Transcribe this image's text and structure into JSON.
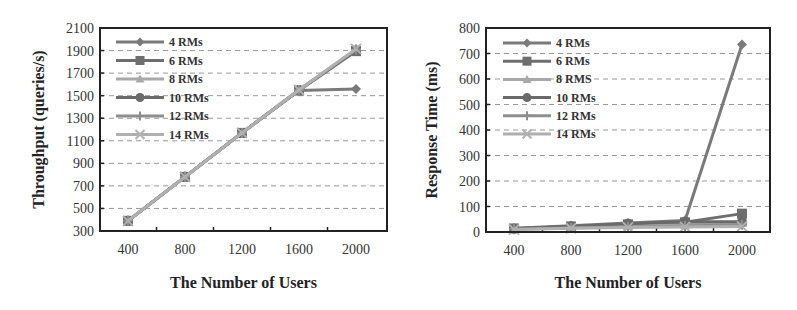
{
  "chart_data": [
    {
      "type": "line",
      "title": "",
      "xlabel": "The Number of Users",
      "ylabel": "Throughput (queries/s)",
      "categories": [
        "400",
        "800",
        "1200",
        "1600",
        "2000"
      ],
      "x": [
        400,
        800,
        1200,
        1600,
        2000
      ],
      "ylim": [
        300,
        2100
      ],
      "yticks": [
        300,
        500,
        700,
        900,
        1100,
        1300,
        1500,
        1700,
        1900,
        2100
      ],
      "grid": "horizontal dashed",
      "legend_position": "upper left inside",
      "series": [
        {
          "name": "4 RMs",
          "marker": "diamond",
          "values": [
            390,
            780,
            1170,
            1545,
            1560
          ]
        },
        {
          "name": "6 RMs",
          "marker": "square",
          "values": [
            390,
            780,
            1170,
            1545,
            1895
          ]
        },
        {
          "name": "8 RMs",
          "marker": "triangle",
          "values": [
            390,
            780,
            1170,
            1550,
            1905
          ]
        },
        {
          "name": "10 RMs",
          "marker": "circle",
          "values": [
            390,
            780,
            1170,
            1550,
            1900
          ]
        },
        {
          "name": "12 RMs",
          "marker": "plus",
          "values": [
            390,
            780,
            1170,
            1550,
            1910
          ]
        },
        {
          "name": "14 RMs",
          "marker": "x",
          "values": [
            390,
            780,
            1170,
            1550,
            1915
          ]
        }
      ]
    },
    {
      "type": "line",
      "title": "",
      "xlabel": "The Number of Users",
      "ylabel": "Response Time (ms)",
      "categories": [
        "400",
        "800",
        "1200",
        "1600",
        "2000"
      ],
      "x": [
        400,
        800,
        1200,
        1600,
        2000
      ],
      "ylim": [
        0,
        800
      ],
      "yticks": [
        0,
        100,
        200,
        300,
        400,
        500,
        600,
        700,
        800
      ],
      "grid": "horizontal dashed",
      "legend_position": "upper left inside",
      "series": [
        {
          "name": "4 RMs",
          "marker": "diamond",
          "values": [
            15,
            25,
            35,
            45,
            735
          ]
        },
        {
          "name": "6 RMs",
          "marker": "square",
          "values": [
            14,
            22,
            30,
            38,
            72
          ]
        },
        {
          "name": "8 RMS",
          "marker": "triangle",
          "values": [
            12,
            18,
            24,
            28,
            35
          ]
        },
        {
          "name": "10 RMs",
          "marker": "circle",
          "values": [
            13,
            22,
            32,
            40,
            40
          ]
        },
        {
          "name": "12 RMs",
          "marker": "plus",
          "values": [
            11,
            16,
            20,
            24,
            28
          ]
        },
        {
          "name": "14 RMs",
          "marker": "x",
          "values": [
            10,
            15,
            18,
            20,
            22
          ]
        }
      ]
    }
  ],
  "colors": {
    "series": [
      "#7a7a7a",
      "#6e6e6e",
      "#a8a8a8",
      "#6a6a6a",
      "#8e8e8e",
      "#b0b0b0"
    ],
    "grid": "#999999",
    "axis": "#222222"
  }
}
